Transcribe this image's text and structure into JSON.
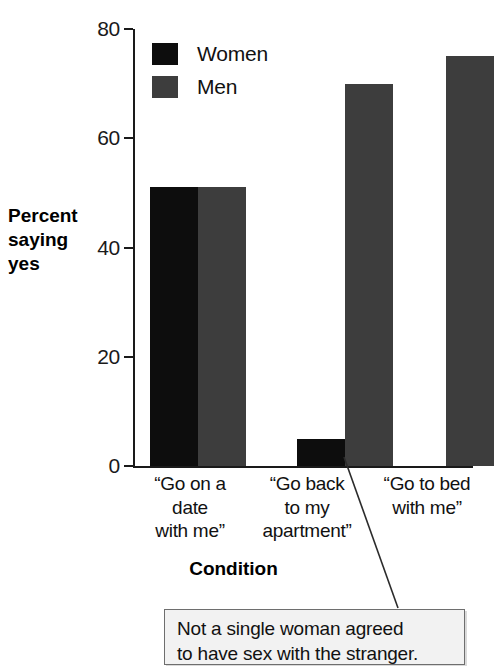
{
  "chart_data": {
    "type": "bar",
    "title": "",
    "xlabel": "Condition",
    "ylabel": "Percent saying yes",
    "ylim": [
      0,
      80
    ],
    "yticks": [
      "0",
      "20",
      "40",
      "60",
      "80"
    ],
    "ytick_values": [
      0,
      20,
      40,
      60,
      80
    ],
    "grid": false,
    "legend_position": "top-left inside axes",
    "categories": [
      "“Go on a date with me”",
      "“Go back to my apartment”",
      "“Go to bed with me”"
    ],
    "category_lines": [
      [
        "“Go on a",
        "date",
        "with me”"
      ],
      [
        "“Go back",
        "to my",
        "apartment”"
      ],
      [
        "“Go to bed",
        "with me”"
      ]
    ],
    "series": [
      {
        "name": "Women",
        "color": "#0d0d0d",
        "values": [
          51,
          5,
          0
        ]
      },
      {
        "name": "Men",
        "color": "#3d3d3d",
        "values": [
          51,
          70,
          75
        ]
      }
    ],
    "annotations": [
      {
        "name": "zero-women-callout",
        "lines": [
          "Not a single woman agreed",
          "to have sex with the stranger."
        ],
        "points_to": {
          "series": "Women",
          "category_index": 2,
          "value": 0
        }
      }
    ]
  },
  "legend": {
    "items": [
      {
        "label": "Women",
        "color": "#0d0d0d"
      },
      {
        "label": "Men",
        "color": "#3d3d3d"
      }
    ]
  },
  "axis": {
    "y_title_lines": [
      "Percent",
      "saying",
      "yes"
    ],
    "x_title": "Condition"
  },
  "colors": {
    "women": "#0d0d0d",
    "men": "#3d3d3d",
    "axis": "#1a1a1a",
    "callout_bg": "#f2f2f2",
    "callout_border": "#6e6e6e",
    "background": "#ffffff"
  }
}
